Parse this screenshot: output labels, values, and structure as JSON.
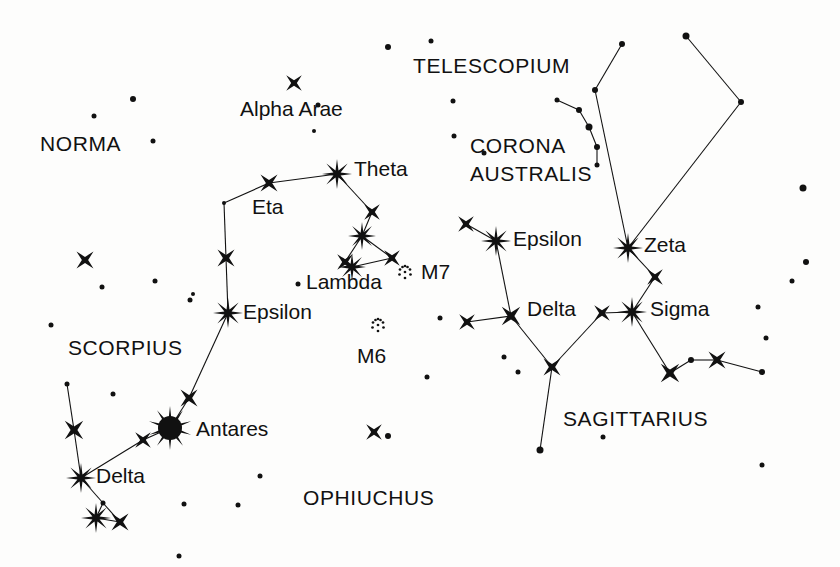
{
  "chart_data": {
    "type": "scatter",
    "xlabel": "",
    "ylabel": "",
    "xlim": [
      0,
      840
    ],
    "ylim": [
      0,
      567
    ],
    "grid": false,
    "legend": "none",
    "background_color": "#fdfdfc",
    "ink_color": "#111111",
    "constellation_labels": [
      {
        "name": "NORMA",
        "text": "NORMA",
        "x": 40,
        "y": 133
      },
      {
        "name": "SCORPIUS",
        "text": "SCORPIUS",
        "x": 68,
        "y": 337
      },
      {
        "name": "OPHIUCHUS",
        "text": "OPHIUCHUS",
        "x": 303,
        "y": 487
      },
      {
        "name": "TELESCOPIUM",
        "text": "TELESCOPIUM",
        "x": 413,
        "y": 55
      },
      {
        "name": "CORONA AUSTRALIS",
        "text": "CORONA",
        "x": 470,
        "y": 135
      },
      {
        "name": "CORONA AUSTRALIS",
        "text": "AUSTRALIS",
        "x": 470,
        "y": 163
      },
      {
        "name": "SAGITTARIUS",
        "text": "SAGITTARIUS",
        "x": 563,
        "y": 408
      }
    ],
    "star_labels": [
      {
        "name": "Alpha Arae",
        "text": "Alpha Arae",
        "x": 240,
        "y": 98
      },
      {
        "name": "Theta",
        "text": "Theta",
        "x": 354,
        "y": 158
      },
      {
        "name": "Eta",
        "text": "Eta",
        "x": 252,
        "y": 196
      },
      {
        "name": "Lambda",
        "text": "Lambda",
        "x": 306,
        "y": 271
      },
      {
        "name": "Epsilon",
        "text": "Epsilon",
        "x": 243,
        "y": 301
      },
      {
        "name": "Antares",
        "text": "Antares",
        "x": 196,
        "y": 418
      },
      {
        "name": "Delta",
        "text": "Delta",
        "x": 96,
        "y": 465
      },
      {
        "name": "Epsilon",
        "text": "Epsilon",
        "x": 513,
        "y": 228
      },
      {
        "name": "Zeta",
        "text": "Zeta",
        "x": 644,
        "y": 234
      },
      {
        "name": "Delta",
        "text": "Delta",
        "x": 527,
        "y": 298
      },
      {
        "name": "Sigma",
        "text": "Sigma",
        "x": 650,
        "y": 298
      }
    ],
    "cluster_labels": [
      {
        "name": "M7",
        "text": "M7",
        "x": 421,
        "y": 261
      },
      {
        "name": "M6",
        "text": "M6",
        "x": 357,
        "y": 345
      }
    ],
    "clusters": [
      {
        "name": "M7",
        "x": 405,
        "y": 272,
        "radius": 7
      },
      {
        "name": "M6",
        "x": 378,
        "y": 325,
        "radius": 7
      }
    ],
    "stars": [
      {
        "name": "alpha-arae",
        "x": 294,
        "y": 83,
        "size": 11,
        "type": "burst4"
      },
      {
        "name": "theta-sco",
        "x": 337,
        "y": 174,
        "size": 15,
        "type": "burst8"
      },
      {
        "name": "eta-sco",
        "x": 269,
        "y": 183,
        "size": 12,
        "type": "burst4"
      },
      {
        "name": "iota-sco",
        "x": 372,
        "y": 212,
        "size": 11,
        "type": "burst4"
      },
      {
        "name": "kappa-sco",
        "x": 362,
        "y": 236,
        "size": 14,
        "type": "burst8"
      },
      {
        "name": "upsilon-sco",
        "x": 345,
        "y": 262,
        "size": 11,
        "type": "burst4"
      },
      {
        "name": "lambda-sco",
        "x": 352,
        "y": 267,
        "size": 14,
        "type": "burst8"
      },
      {
        "name": "mu-sco",
        "x": 392,
        "y": 258,
        "size": 11,
        "type": "burst4"
      },
      {
        "name": "dot-sco-bend",
        "x": 224,
        "y": 203,
        "size": 4,
        "type": "dot"
      },
      {
        "name": "mu2-sco",
        "x": 226,
        "y": 258,
        "size": 12,
        "type": "burst4"
      },
      {
        "name": "epsilon-sco",
        "x": 228,
        "y": 313,
        "size": 15,
        "type": "burst8"
      },
      {
        "name": "tau-sco",
        "x": 189,
        "y": 398,
        "size": 12,
        "type": "burst4"
      },
      {
        "name": "antares",
        "x": 170,
        "y": 428,
        "size": 24,
        "type": "disc"
      },
      {
        "name": "sigma-sco",
        "x": 143,
        "y": 440,
        "size": 11,
        "type": "burst4"
      },
      {
        "name": "delta-sco",
        "x": 81,
        "y": 478,
        "size": 15,
        "type": "burst8"
      },
      {
        "name": "beta-sco",
        "x": 74,
        "y": 430,
        "size": 13,
        "type": "burst4"
      },
      {
        "name": "nu-sco-dot",
        "x": 67,
        "y": 384,
        "size": 5,
        "type": "dot"
      },
      {
        "name": "pi-sco",
        "x": 96,
        "y": 518,
        "size": 15,
        "type": "burst8"
      },
      {
        "name": "rho-sco",
        "x": 120,
        "y": 522,
        "size": 12,
        "type": "burst4"
      },
      {
        "name": "dot-claw",
        "x": 103,
        "y": 503,
        "size": 5,
        "type": "dot"
      },
      {
        "name": "sco-field-1",
        "x": 85,
        "y": 260,
        "size": 12,
        "type": "burst4"
      },
      {
        "name": "ophiuchus-star",
        "x": 374,
        "y": 432,
        "size": 11,
        "type": "burst4"
      },
      {
        "name": "epsilon-sgr",
        "x": 496,
        "y": 241,
        "size": 15,
        "type": "burst8"
      },
      {
        "name": "eta-sgr",
        "x": 466,
        "y": 224,
        "size": 11,
        "type": "burst4"
      },
      {
        "name": "delta-sgr",
        "x": 511,
        "y": 316,
        "size": 13,
        "type": "burst4"
      },
      {
        "name": "gamma-sgr",
        "x": 467,
        "y": 322,
        "size": 11,
        "type": "burst4"
      },
      {
        "name": "eta2-sgr",
        "x": 552,
        "y": 367,
        "size": 12,
        "type": "burst4"
      },
      {
        "name": "phi-sgr",
        "x": 602,
        "y": 313,
        "size": 11,
        "type": "burst4"
      },
      {
        "name": "sigma-sgr",
        "x": 632,
        "y": 312,
        "size": 15,
        "type": "burst8"
      },
      {
        "name": "tau-sgr",
        "x": 655,
        "y": 277,
        "size": 11,
        "type": "burst4"
      },
      {
        "name": "zeta-sgr",
        "x": 628,
        "y": 248,
        "size": 15,
        "type": "burst8"
      },
      {
        "name": "sgr-handle-1",
        "x": 670,
        "y": 373,
        "size": 13,
        "type": "burst4"
      },
      {
        "name": "sgr-handle-dot",
        "x": 691,
        "y": 360,
        "size": 6,
        "type": "dot"
      },
      {
        "name": "sgr-handle-2",
        "x": 717,
        "y": 360,
        "size": 12,
        "type": "burst4"
      },
      {
        "name": "sgr-handle-3",
        "x": 762,
        "y": 372,
        "size": 6,
        "type": "dot"
      },
      {
        "name": "sgr-upper-dot-1",
        "x": 595,
        "y": 90,
        "size": 6,
        "type": "dot"
      },
      {
        "name": "sgr-upper-dot-2",
        "x": 622,
        "y": 44,
        "size": 6,
        "type": "dot"
      },
      {
        "name": "sgr-upper-dot-3",
        "x": 686,
        "y": 36,
        "size": 7,
        "type": "dot"
      },
      {
        "name": "sgr-upper-dot-4",
        "x": 741,
        "y": 102,
        "size": 6,
        "type": "dot"
      },
      {
        "name": "cra-dot-1",
        "x": 557,
        "y": 100,
        "size": 5,
        "type": "dot"
      },
      {
        "name": "cra-dot-2",
        "x": 579,
        "y": 110,
        "size": 6,
        "type": "dot"
      },
      {
        "name": "cra-dot-3",
        "x": 589,
        "y": 127,
        "size": 7,
        "type": "dot"
      },
      {
        "name": "cra-dot-4",
        "x": 597,
        "y": 147,
        "size": 6,
        "type": "dot"
      },
      {
        "name": "cra-dot-5",
        "x": 597,
        "y": 165,
        "size": 5,
        "type": "dot"
      },
      {
        "name": "field-dot-1",
        "x": 94,
        "y": 116,
        "size": 5,
        "type": "dot"
      },
      {
        "name": "field-dot-2",
        "x": 133,
        "y": 99,
        "size": 6,
        "type": "dot"
      },
      {
        "name": "field-dot-3",
        "x": 153,
        "y": 141,
        "size": 5,
        "type": "dot"
      },
      {
        "name": "field-dot-4",
        "x": 102,
        "y": 287,
        "size": 5,
        "type": "dot"
      },
      {
        "name": "field-dot-5",
        "x": 51,
        "y": 325,
        "size": 5,
        "type": "dot"
      },
      {
        "name": "field-dot-6",
        "x": 190,
        "y": 300,
        "size": 5,
        "type": "dot"
      },
      {
        "name": "field-dot-7",
        "x": 155,
        "y": 281,
        "size": 5,
        "type": "dot"
      },
      {
        "name": "field-dot-8",
        "x": 113,
        "y": 394,
        "size": 5,
        "type": "dot"
      },
      {
        "name": "field-dot-9",
        "x": 184,
        "y": 504,
        "size": 5,
        "type": "dot"
      },
      {
        "name": "field-dot-10",
        "x": 238,
        "y": 505,
        "size": 5,
        "type": "dot"
      },
      {
        "name": "field-dot-11",
        "x": 260,
        "y": 476,
        "size": 5,
        "type": "dot"
      },
      {
        "name": "field-dot-12",
        "x": 179,
        "y": 556,
        "size": 5,
        "type": "dot"
      },
      {
        "name": "field-dot-13",
        "x": 318,
        "y": 105,
        "size": 5,
        "type": "dot"
      },
      {
        "name": "field-dot-14",
        "x": 298,
        "y": 284,
        "size": 5,
        "type": "dot"
      },
      {
        "name": "field-dot-15",
        "x": 193,
        "y": 294,
        "size": 4,
        "type": "dot"
      },
      {
        "name": "field-dot-16",
        "x": 388,
        "y": 436,
        "size": 6,
        "type": "dot"
      },
      {
        "name": "field-dot-17",
        "x": 427,
        "y": 377,
        "size": 5,
        "type": "dot"
      },
      {
        "name": "field-dot-18",
        "x": 388,
        "y": 47,
        "size": 6,
        "type": "dot"
      },
      {
        "name": "field-dot-19",
        "x": 431,
        "y": 41,
        "size": 5,
        "type": "dot"
      },
      {
        "name": "field-dot-20",
        "x": 453,
        "y": 101,
        "size": 5,
        "type": "dot"
      },
      {
        "name": "field-dot-21",
        "x": 454,
        "y": 136,
        "size": 5,
        "type": "dot"
      },
      {
        "name": "field-dot-22",
        "x": 484,
        "y": 153,
        "size": 5,
        "type": "dot"
      },
      {
        "name": "field-dot-23",
        "x": 504,
        "y": 357,
        "size": 5,
        "type": "dot"
      },
      {
        "name": "field-dot-24",
        "x": 518,
        "y": 372,
        "size": 5,
        "type": "dot"
      },
      {
        "name": "field-dot-25",
        "x": 603,
        "y": 437,
        "size": 5,
        "type": "dot"
      },
      {
        "name": "field-dot-26",
        "x": 762,
        "y": 465,
        "size": 5,
        "type": "dot"
      },
      {
        "name": "field-dot-27",
        "x": 803,
        "y": 188,
        "size": 7,
        "type": "dot"
      },
      {
        "name": "field-dot-28",
        "x": 806,
        "y": 262,
        "size": 6,
        "type": "dot"
      },
      {
        "name": "field-dot-29",
        "x": 792,
        "y": 281,
        "size": 5,
        "type": "dot"
      },
      {
        "name": "field-dot-30",
        "x": 758,
        "y": 307,
        "size": 5,
        "type": "dot"
      },
      {
        "name": "field-dot-31",
        "x": 766,
        "y": 338,
        "size": 5,
        "type": "dot"
      },
      {
        "name": "field-dot-32",
        "x": 440,
        "y": 318,
        "size": 5,
        "type": "dot"
      },
      {
        "name": "field-dot-33",
        "x": 314,
        "y": 131,
        "size": 4,
        "type": "dot"
      }
    ],
    "constellation_lines": [
      {
        "name": "sco-eta-theta",
        "x1": 269,
        "y1": 183,
        "x2": 337,
        "y2": 174
      },
      {
        "name": "sco-bend-eta",
        "x1": 224,
        "y1": 203,
        "x2": 269,
        "y2": 183
      },
      {
        "name": "sco-bend-mu2",
        "x1": 224,
        "y1": 203,
        "x2": 226,
        "y2": 258
      },
      {
        "name": "sco-mu2-epsilon",
        "x1": 226,
        "y1": 258,
        "x2": 228,
        "y2": 313
      },
      {
        "name": "sco-epsilon-tau",
        "x1": 228,
        "y1": 313,
        "x2": 189,
        "y2": 398
      },
      {
        "name": "sco-tau-antares",
        "x1": 189,
        "y1": 398,
        "x2": 170,
        "y2": 428
      },
      {
        "name": "sco-antares-sigma",
        "x1": 170,
        "y1": 428,
        "x2": 143,
        "y2": 440
      },
      {
        "name": "sco-sigma-delta",
        "x1": 143,
        "y1": 440,
        "x2": 81,
        "y2": 478
      },
      {
        "name": "sco-delta-beta",
        "x1": 81,
        "y1": 478,
        "x2": 74,
        "y2": 430
      },
      {
        "name": "sco-beta-nu",
        "x1": 74,
        "y1": 430,
        "x2": 67,
        "y2": 384
      },
      {
        "name": "sco-delta-dotclaw",
        "x1": 81,
        "y1": 478,
        "x2": 103,
        "y2": 503
      },
      {
        "name": "sco-dotclaw-pi",
        "x1": 103,
        "y1": 503,
        "x2": 96,
        "y2": 518
      },
      {
        "name": "sco-pi-rho",
        "x1": 96,
        "y1": 518,
        "x2": 120,
        "y2": 522
      },
      {
        "name": "sco-dotclaw-rho",
        "x1": 103,
        "y1": 503,
        "x2": 120,
        "y2": 522
      },
      {
        "name": "sco-theta-iota",
        "x1": 337,
        "y1": 174,
        "x2": 372,
        "y2": 212
      },
      {
        "name": "sco-iota-kappa",
        "x1": 372,
        "y1": 212,
        "x2": 362,
        "y2": 236
      },
      {
        "name": "sco-kappa-upsilon",
        "x1": 362,
        "y1": 236,
        "x2": 345,
        "y2": 262
      },
      {
        "name": "sco-kappa-mu",
        "x1": 362,
        "y1": 236,
        "x2": 392,
        "y2": 258
      },
      {
        "name": "sco-mu-lambda",
        "x1": 392,
        "y1": 258,
        "x2": 352,
        "y2": 267
      },
      {
        "name": "sco-lambda-upsilon",
        "x1": 352,
        "y1": 267,
        "x2": 345,
        "y2": 262
      },
      {
        "name": "sgr-eta-epsilon",
        "x1": 466,
        "y1": 224,
        "x2": 496,
        "y2": 241
      },
      {
        "name": "sgr-epsilon-delta",
        "x1": 496,
        "y1": 241,
        "x2": 511,
        "y2": 316
      },
      {
        "name": "sgr-gamma-delta",
        "x1": 467,
        "y1": 322,
        "x2": 511,
        "y2": 316
      },
      {
        "name": "sgr-delta-eta2",
        "x1": 511,
        "y1": 316,
        "x2": 552,
        "y2": 367
      },
      {
        "name": "sgr-eta2-phi",
        "x1": 552,
        "y1": 367,
        "x2": 602,
        "y2": 313
      },
      {
        "name": "sgr-phi-sigma",
        "x1": 602,
        "y1": 313,
        "x2": 632,
        "y2": 312
      },
      {
        "name": "sgr-sigma-tau",
        "x1": 632,
        "y1": 312,
        "x2": 655,
        "y2": 277
      },
      {
        "name": "sgr-tau-zeta",
        "x1": 655,
        "y1": 277,
        "x2": 628,
        "y2": 248
      },
      {
        "name": "sgr-zeta-updot1",
        "x1": 628,
        "y1": 248,
        "x2": 595,
        "y2": 90
      },
      {
        "name": "sgr-updot1-updot2",
        "x1": 595,
        "y1": 90,
        "x2": 622,
        "y2": 44
      },
      {
        "name": "sgr-zeta-updot4",
        "x1": 628,
        "y1": 248,
        "x2": 741,
        "y2": 102
      },
      {
        "name": "sgr-updot4-updot3",
        "x1": 741,
        "y1": 102,
        "x2": 686,
        "y2": 36
      },
      {
        "name": "sgr-sigma-handle1",
        "x1": 632,
        "y1": 312,
        "x2": 670,
        "y2": 373
      },
      {
        "name": "sgr-handle1-dot",
        "x1": 670,
        "y1": 373,
        "x2": 691,
        "y2": 360
      },
      {
        "name": "sgr-dot-handle2",
        "x1": 691,
        "y1": 360,
        "x2": 717,
        "y2": 360
      },
      {
        "name": "sgr-handle2-handle3",
        "x1": 717,
        "y1": 360,
        "x2": 762,
        "y2": 372
      },
      {
        "name": "sgr-eta2-down",
        "x1": 552,
        "y1": 367,
        "x2": 540,
        "y2": 450
      },
      {
        "name": "cra-arc-1",
        "x1": 557,
        "y1": 100,
        "x2": 579,
        "y2": 110
      },
      {
        "name": "cra-arc-2",
        "x1": 579,
        "y1": 110,
        "x2": 589,
        "y2": 127
      },
      {
        "name": "cra-arc-3",
        "x1": 589,
        "y1": 127,
        "x2": 597,
        "y2": 147
      },
      {
        "name": "cra-arc-4",
        "x1": 597,
        "y1": 147,
        "x2": 597,
        "y2": 165
      }
    ],
    "extra_stars": [
      {
        "name": "sgr-bottom-dot",
        "x": 540,
        "y": 450,
        "size": 7,
        "type": "dot"
      }
    ]
  }
}
